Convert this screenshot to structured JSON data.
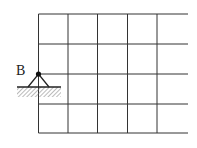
{
  "diagram": {
    "label_B": "B",
    "grid": {
      "columns_x": [
        38.5,
        68,
        97.5,
        127.5,
        157
      ],
      "rows_y": [
        14,
        44,
        74,
        104,
        133
      ],
      "right_end_x": 188,
      "line_color": "#333333"
    },
    "support": {
      "type": "pin",
      "node_x": 38.5,
      "node_y": 74,
      "ground_y": 87,
      "hatch_left_x": 17,
      "hatch_right_x": 61
    }
  }
}
